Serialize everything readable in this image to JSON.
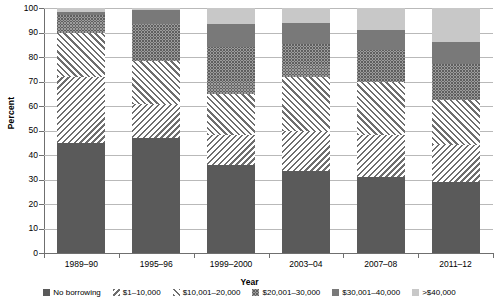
{
  "chart_data": {
    "type": "bar",
    "subtype": "stacked-bar-100-percent",
    "title": "",
    "xlabel": "Year",
    "ylabel": "Percent",
    "ylim": [
      0,
      100
    ],
    "ytick_step": 10,
    "yticks": [
      100,
      90,
      80,
      70,
      60,
      50,
      40,
      30,
      20,
      10,
      0
    ],
    "grid": true,
    "legend_position": "bottom",
    "categories": [
      "1989–90",
      "1995–96",
      "1999–2000",
      "2003–04",
      "2007–08",
      "2011–12"
    ],
    "series": [
      {
        "name": "No borrowing",
        "key": "none",
        "pattern": "solid-dark",
        "color": "#5a5a5a",
        "values": [
          45,
          47,
          36,
          33.5,
          31,
          29
        ]
      },
      {
        "name": "$1–10,000",
        "key": "1-10k",
        "pattern": "diagonal-hatch-down",
        "color": "#6e6e6e",
        "values": [
          27,
          14,
          12,
          16.5,
          17,
          15
        ]
      },
      {
        "name": "$10,001–20,000",
        "key": "10-20k",
        "pattern": "diagonal-hatch-up",
        "color": "#6e6e6e",
        "values": [
          18,
          17.5,
          17,
          22,
          22,
          18.5
        ]
      },
      {
        "name": "$20,001–30,000",
        "key": "20-30k",
        "pattern": "checkerboard",
        "color": "#5f5f5f",
        "values": [
          7,
          15,
          19,
          13.5,
          13,
          14.5
        ]
      },
      {
        "name": "$30,001–40,000",
        "key": "30-40k",
        "pattern": "solid-mid-gray",
        "color": "#797979",
        "values": [
          1.5,
          5.5,
          9.5,
          8.5,
          8,
          9
        ]
      },
      {
        "name": ">$40,000",
        "key": "40k-plus",
        "pattern": "solid-light-gray",
        "color": "#c8c8c8",
        "values": [
          1.5,
          1,
          6.5,
          6,
          9,
          14
        ]
      }
    ]
  },
  "axes": {
    "y_title": "Percent",
    "x_title": "Year"
  }
}
